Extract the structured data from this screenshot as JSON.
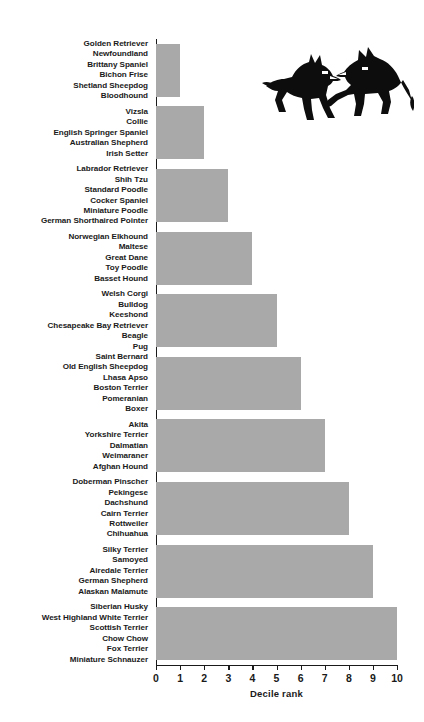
{
  "chart_data": {
    "type": "bar",
    "orientation": "horizontal",
    "title": "",
    "xlabel": "Decile rank",
    "ylabel": "",
    "xlim": [
      0,
      10
    ],
    "ylim": null,
    "grid": false,
    "legend": null,
    "bar_color": "#a9a9a9",
    "axis_color": "#1a1a1a",
    "xticks": [
      0,
      1,
      2,
      3,
      4,
      5,
      6,
      7,
      8,
      9,
      10
    ],
    "xticklabels": [
      "0",
      "1",
      "2",
      "3",
      "4",
      "5",
      "6",
      "7",
      "8",
      "9",
      "10"
    ],
    "categories": [
      "Golden Retriever / Newfoundland / Brittany Spaniel / Bichon Frise / Shetland Sheepdog / Bloodhound",
      "Vizsla / Collie / English Springer Spaniel / Australian Shepherd / Irish Setter",
      "Labrador Retriever / Shih Tzu / Standard Poodle / Cocker Spaniel / Miniature Poodle / German Shorthaired Pointer",
      "Norwegian Elkhound / Maltese / Great Dane / Toy Poodle / Basset Hound",
      "Welsh Corgi / Bulldog / Keeshond / Chesapeake Bay Retriever / Beagle / Pug",
      "Saint Bernard / Old English Sheepdog / Lhasa Apso / Boston Terrier / Pomeranian / Boxer",
      "Akita / Yorkshire Terrier / Dalmatian / Weimaraner / Afghan Hound",
      "Doberman Pinscher / Pekingese / Dachshund / Cairn Terrier / Rottweiler / Chihuahua",
      "Silky Terrier / Samoyed / Airedale Terrier / German Shepherd / Alaskan Malamute",
      "Siberian Husky / West Highland White Terrier / Scottish Terrier / Chow Chow / Fox Terrier / Miniature Schnauzer"
    ],
    "values": [
      1,
      2,
      3,
      4,
      5,
      6,
      7,
      8,
      9,
      10
    ]
  },
  "groups": [
    {
      "value": 1,
      "breeds": [
        "Golden Retriever",
        "Newfoundland",
        "Brittany Spaniel",
        "Bichon Frise",
        "Shetland Sheepdog",
        "Bloodhound"
      ]
    },
    {
      "value": 2,
      "breeds": [
        "Vizsla",
        "Collie",
        "English Springer Spaniel",
        "Australian Shepherd",
        "Irish Setter"
      ]
    },
    {
      "value": 3,
      "breeds": [
        "Labrador Retriever",
        "Shih Tzu",
        "Standard Poodle",
        "Cocker Spaniel",
        "Miniature Poodle",
        "German Shorthaired Pointer"
      ]
    },
    {
      "value": 4,
      "breeds": [
        "Norwegian Elkhound",
        "Maltese",
        "Great Dane",
        "Toy Poodle",
        "Basset Hound"
      ]
    },
    {
      "value": 5,
      "breeds": [
        "Welsh Corgi",
        "Bulldog",
        "Keeshond",
        "Chesapeake Bay Retriever",
        "Beagle",
        "Pug"
      ]
    },
    {
      "value": 6,
      "breeds": [
        "Saint Bernard",
        "Old English Sheepdog",
        "Lhasa Apso",
        "Boston Terrier",
        "Pomeranian",
        "Boxer"
      ]
    },
    {
      "value": 7,
      "breeds": [
        "Akita",
        "Yorkshire Terrier",
        "Dalmatian",
        "Weimaraner",
        "Afghan Hound"
      ]
    },
    {
      "value": 8,
      "breeds": [
        "Doberman Pinscher",
        "Pekingese",
        "Dachshund",
        "Cairn Terrier",
        "Rottweiler",
        "Chihuahua"
      ]
    },
    {
      "value": 9,
      "breeds": [
        "Silky Terrier",
        "Samoyed",
        "Airedale Terrier",
        "German Shepherd",
        "Alaskan Malamute"
      ]
    },
    {
      "value": 10,
      "breeds": [
        "Siberian Husky",
        "West Highland White Terrier",
        "Scottish Terrier",
        "Chow Chow",
        "Fox Terrier",
        "Miniature Schnauzer"
      ]
    }
  ],
  "decoration": {
    "dogs_icon": "two-dogs-silhouette"
  }
}
